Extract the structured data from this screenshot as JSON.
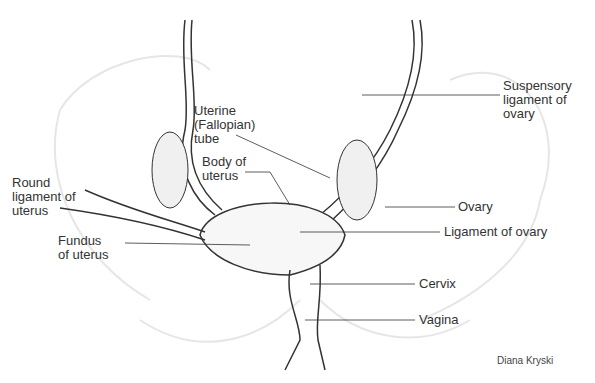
{
  "labels": {
    "suspensory": "Suspensory ligament of ovary",
    "suspensory_l1": "Suspensory",
    "suspensory_l2": "ligament of",
    "suspensory_l3": "ovary",
    "uterine_l1": "Uterine",
    "uterine_l2": "(Fallopian)",
    "uterine_l3": "tube",
    "body_l1": "Body of",
    "body_l2": "uterus",
    "round_l1": "Round",
    "round_l2": "ligament of",
    "round_l3": "uterus",
    "ovary": "Ovary",
    "ligament_ovary": "Ligament of ovary",
    "fundus_l1": "Fundus",
    "fundus_l2": "of uterus",
    "cervix": "Cervix",
    "vagina": "Vagina"
  },
  "credit": "Diana Kryski"
}
